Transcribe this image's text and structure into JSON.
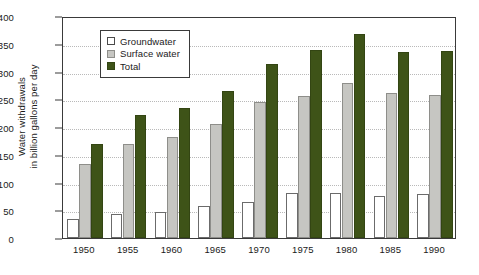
{
  "chart_data": {
    "type": "bar",
    "title": "",
    "subtitle": "",
    "xlabel": "",
    "ylabel": "Water withdrawals\nin billion gallons per day",
    "ylim": [
      0,
      400
    ],
    "ytick_step": 50,
    "yticks": [
      "0",
      "50",
      "100",
      "150",
      "200",
      "250",
      "300",
      "350",
      "400"
    ],
    "grid": "horizontal-dotted",
    "legend_position": "upper-left-inside",
    "categories": [
      "1950",
      "1955",
      "1960",
      "1965",
      "1970",
      "1975",
      "1980",
      "1985",
      "1990"
    ],
    "series": [
      {
        "name": "Groundwater",
        "color": "#ffffff",
        "values": [
          34,
          43,
          47,
          57,
          65,
          81,
          82,
          76,
          80
        ]
      },
      {
        "name": "Surface water",
        "color": "#c6c6c2",
        "values": [
          133,
          170,
          182,
          205,
          245,
          255,
          280,
          262,
          258
        ]
      },
      {
        "name": "Total",
        "color": "#3e5318",
        "values": [
          170,
          222,
          235,
          264,
          314,
          339,
          368,
          336,
          337
        ]
      }
    ]
  },
  "legend": {
    "items": [
      {
        "label": "Groundwater"
      },
      {
        "label": "Surface water"
      },
      {
        "label": "Total"
      }
    ]
  },
  "colors": {
    "groundwater": "#ffffff",
    "surface_water": "#c6c6c2",
    "total": "#3e5318",
    "axis": "#3a3a3a",
    "grid": "#b9b9b9",
    "background": "#ffffff"
  }
}
